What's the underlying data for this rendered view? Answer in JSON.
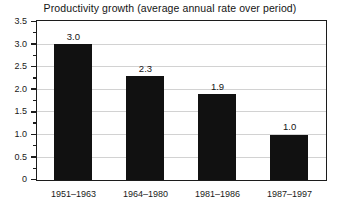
{
  "chart_data": {
    "type": "bar",
    "title": "Productivity growth (average annual rate over period)",
    "xlabel": "",
    "ylabel": "",
    "categories": [
      "1951–1963",
      "1964–1980",
      "1981–1986",
      "1987–1997"
    ],
    "values": [
      3.0,
      2.3,
      1.9,
      1.0
    ],
    "value_labels": [
      "3.0",
      "2.3",
      "1.9",
      "1.0"
    ],
    "ylim": [
      0,
      3.5
    ],
    "ytick_labels": [
      "0",
      "0.5",
      "1.0",
      "1.5",
      "2.0",
      "2.5",
      "3.0",
      "3.5"
    ],
    "ytick_values": [
      0,
      0.5,
      1.0,
      1.5,
      2.0,
      2.5,
      3.0,
      3.5
    ],
    "yminor_values": [
      0.25,
      0.75,
      1.25,
      1.75,
      2.25,
      2.75,
      3.25
    ],
    "grid": true,
    "legend": null,
    "bar_color": "#111111",
    "grid_color": "#d2d2d2",
    "frame_color": "#1c1c1c",
    "background_color": "#ffffff"
  }
}
